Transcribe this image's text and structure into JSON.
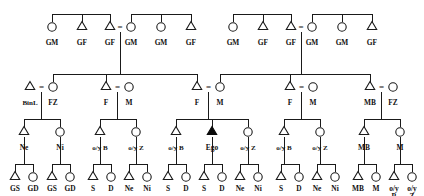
{
  "diagram": {
    "type": "pedigree",
    "symbols": {
      "male": "triangle",
      "female": "circle",
      "ego": "filled-triangle",
      "mating": "="
    },
    "colors": {
      "line": "#1a1a1a",
      "fill_ego": "#0a0a0a",
      "background": "#ffffff"
    }
  },
  "generations": [
    {
      "id": "g1",
      "y": 28,
      "label_y": 45,
      "people": [
        {
          "id": "g1p1",
          "x": 52,
          "sex": "female",
          "label": "GM"
        },
        {
          "id": "g1p2",
          "x": 82,
          "sex": "male",
          "label": "GF"
        },
        {
          "id": "g1p3",
          "x": 110,
          "sex": "male",
          "label": "GF"
        },
        {
          "id": "g1p4",
          "x": 131,
          "sex": "female",
          "label": "GM"
        },
        {
          "id": "g1p5",
          "x": 161,
          "sex": "female",
          "label": "GM"
        },
        {
          "id": "g1p6",
          "x": 191,
          "sex": "male",
          "label": "GF"
        },
        {
          "id": "g1p7",
          "x": 233,
          "sex": "female",
          "label": "GM"
        },
        {
          "id": "g1p8",
          "x": 263,
          "sex": "male",
          "label": "GF"
        },
        {
          "id": "g1p9",
          "x": 291,
          "sex": "male",
          "label": "GF"
        },
        {
          "id": "g1p10",
          "x": 312,
          "sex": "female",
          "label": "GM"
        },
        {
          "id": "g1p11",
          "x": 342,
          "sex": "female",
          "label": "GM"
        },
        {
          "id": "g1p12",
          "x": 372,
          "sex": "male",
          "label": "GF"
        }
      ],
      "matings": [
        {
          "id": "g1m1",
          "x": 120,
          "left": "g1p3",
          "right": "g1p4"
        },
        {
          "id": "g1m2",
          "x": 301,
          "left": "g1p9",
          "right": "g1p10"
        }
      ]
    },
    {
      "id": "g2",
      "y": 88,
      "label_y": 105,
      "people": [
        {
          "id": "g2p1",
          "x": 30,
          "sex": "male",
          "label": "BinL"
        },
        {
          "id": "g2p2",
          "x": 53,
          "sex": "female",
          "label": "FZ"
        },
        {
          "id": "g2p3",
          "x": 106,
          "sex": "male",
          "label": "F"
        },
        {
          "id": "g2p4",
          "x": 129,
          "sex": "female",
          "label": "M"
        },
        {
          "id": "g2p5",
          "x": 197,
          "sex": "male",
          "label": "F"
        },
        {
          "id": "g2p6",
          "x": 220,
          "sex": "female",
          "label": "M"
        },
        {
          "id": "g2p7",
          "x": 290,
          "sex": "male",
          "label": "F"
        },
        {
          "id": "g2p8",
          "x": 313,
          "sex": "female",
          "label": "M"
        },
        {
          "id": "g2p9",
          "x": 370,
          "sex": "male",
          "label": "MB"
        },
        {
          "id": "g2p10",
          "x": 393,
          "sex": "female",
          "label": "FZ"
        }
      ],
      "matings": [
        {
          "id": "g2m1",
          "x": 41.5,
          "left": "g2p1",
          "right": "g2p2"
        },
        {
          "id": "g2m2",
          "x": 117.5,
          "left": "g2p3",
          "right": "g2p4"
        },
        {
          "id": "g2m3",
          "x": 208.5,
          "left": "g2p5",
          "right": "g2p6"
        },
        {
          "id": "g2m4",
          "x": 301.5,
          "left": "g2p7",
          "right": "g2p8"
        },
        {
          "id": "g2m5",
          "x": 381.5,
          "left": "g2p9",
          "right": "g2p10"
        }
      ]
    },
    {
      "id": "g3",
      "y": 133,
      "label_y": 150,
      "people": [
        {
          "id": "g3p1",
          "x": 24,
          "sex": "male",
          "label": "Ne"
        },
        {
          "id": "g3p2",
          "x": 60,
          "sex": "female",
          "label": "Ni"
        },
        {
          "id": "g3p3",
          "x": 100,
          "sex": "male",
          "label": "o/y B"
        },
        {
          "id": "g3p4",
          "x": 136,
          "sex": "female",
          "label": "o/y Z"
        },
        {
          "id": "g3p5",
          "x": 176,
          "sex": "male",
          "label": "o/y B"
        },
        {
          "id": "g3p6",
          "x": 212,
          "sex": "ego",
          "label": "Ego"
        },
        {
          "id": "g3p7",
          "x": 248,
          "sex": "female",
          "label": "o/y Z"
        },
        {
          "id": "g3p8",
          "x": 284,
          "sex": "male",
          "label": "o/y B"
        },
        {
          "id": "g3p9",
          "x": 320,
          "sex": "female",
          "label": "o/y Z"
        },
        {
          "id": "g3p10",
          "x": 364,
          "sex": "male",
          "label": "MB"
        },
        {
          "id": "g3p11",
          "x": 400,
          "sex": "female",
          "label": "M"
        }
      ]
    },
    {
      "id": "g4",
      "y": 178,
      "label_y": 191,
      "people": [
        {
          "id": "g4p1",
          "x": 15,
          "sex": "male",
          "label": "GS"
        },
        {
          "id": "g4p2",
          "x": 33,
          "sex": "female",
          "label": "GD"
        },
        {
          "id": "g4p3",
          "x": 52,
          "sex": "male",
          "label": "GS"
        },
        {
          "id": "g4p4",
          "x": 70,
          "sex": "female",
          "label": "GD"
        },
        {
          "id": "g4p5",
          "x": 93,
          "sex": "male",
          "label": "S"
        },
        {
          "id": "g4p6",
          "x": 111,
          "sex": "female",
          "label": "D"
        },
        {
          "id": "g4p7",
          "x": 129,
          "sex": "male",
          "label": "Ne"
        },
        {
          "id": "g4p8",
          "x": 147,
          "sex": "female",
          "label": "Ni"
        },
        {
          "id": "g4p9",
          "x": 168,
          "sex": "male",
          "label": "S"
        },
        {
          "id": "g4p10",
          "x": 186,
          "sex": "female",
          "label": "D"
        },
        {
          "id": "g4p11",
          "x": 204,
          "sex": "male",
          "label": "S"
        },
        {
          "id": "g4p12",
          "x": 222,
          "sex": "female",
          "label": "D"
        },
        {
          "id": "g4p13",
          "x": 240,
          "sex": "male",
          "label": "Ne"
        },
        {
          "id": "g4p14",
          "x": 258,
          "sex": "female",
          "label": "Ni"
        },
        {
          "id": "g4p15",
          "x": 281,
          "sex": "male",
          "label": "S"
        },
        {
          "id": "g4p16",
          "x": 299,
          "sex": "female",
          "label": "D"
        },
        {
          "id": "g4p17",
          "x": 317,
          "sex": "male",
          "label": "Ne"
        },
        {
          "id": "g4p18",
          "x": 335,
          "sex": "female",
          "label": "Ni"
        },
        {
          "id": "g4p19",
          "x": 358,
          "sex": "male",
          "label": "MB"
        },
        {
          "id": "g4p20",
          "x": 376,
          "sex": "female",
          "label": "M"
        },
        {
          "id": "g4p21",
          "x": 394,
          "sex": "male",
          "label": "o/y",
          "label2": "B"
        },
        {
          "id": "g4p22",
          "x": 412,
          "sex": "female",
          "label": "o/y",
          "label2": "Z"
        }
      ]
    }
  ],
  "sibships": [
    {
      "id": "s1",
      "bar_y": 14,
      "drop_to": 22,
      "parent_drop_x": null,
      "children_x": [
        52,
        82,
        110
      ]
    },
    {
      "id": "s2",
      "bar_y": 14,
      "drop_to": 22,
      "parent_drop_x": null,
      "children_x": [
        131,
        161,
        191
      ]
    },
    {
      "id": "s3",
      "bar_y": 14,
      "drop_to": 22,
      "parent_drop_x": null,
      "children_x": [
        233,
        263,
        291
      ]
    },
    {
      "id": "s4",
      "bar_y": 14,
      "drop_to": 22,
      "parent_drop_x": null,
      "children_x": [
        312,
        342,
        372
      ]
    },
    {
      "id": "s5",
      "bar_y": 74,
      "drop_to": 82,
      "parent_drop_x": 120,
      "children_x": [
        53,
        106,
        197
      ]
    },
    {
      "id": "s6",
      "bar_y": 74,
      "drop_to": 82,
      "parent_drop_x": 301,
      "children_x": [
        220,
        290,
        370
      ]
    },
    {
      "id": "s7",
      "bar_y": 119,
      "drop_to": 127,
      "parent_drop_x": 41.5,
      "children_x": [
        24,
        60
      ]
    },
    {
      "id": "s8",
      "bar_y": 119,
      "drop_to": 127,
      "parent_drop_x": 117.5,
      "children_x": [
        100,
        136
      ]
    },
    {
      "id": "s9",
      "bar_y": 119,
      "drop_to": 127,
      "parent_drop_x": 208.5,
      "children_x": [
        176,
        212,
        248
      ]
    },
    {
      "id": "s10",
      "bar_y": 119,
      "drop_to": 127,
      "parent_drop_x": 301.5,
      "children_x": [
        284,
        320
      ]
    },
    {
      "id": "s11",
      "bar_y": 119,
      "drop_to": 127,
      "parent_drop_x": 381.5,
      "children_x": [
        364,
        400
      ]
    },
    {
      "id": "s12",
      "bar_y": 164,
      "drop_to": 172,
      "parent_drop_x": 24,
      "children_x": [
        15,
        33
      ]
    },
    {
      "id": "s13",
      "bar_y": 164,
      "drop_to": 172,
      "parent_drop_x": 60,
      "children_x": [
        52,
        70
      ]
    },
    {
      "id": "s14",
      "bar_y": 164,
      "drop_to": 172,
      "parent_drop_x": 100,
      "children_x": [
        93,
        111
      ]
    },
    {
      "id": "s15",
      "bar_y": 164,
      "drop_to": 172,
      "parent_drop_x": 136,
      "children_x": [
        129,
        147
      ]
    },
    {
      "id": "s16",
      "bar_y": 164,
      "drop_to": 172,
      "parent_drop_x": 176,
      "children_x": [
        168,
        186
      ]
    },
    {
      "id": "s17",
      "bar_y": 164,
      "drop_to": 172,
      "parent_drop_x": 212,
      "children_x": [
        204,
        222
      ]
    },
    {
      "id": "s18",
      "bar_y": 164,
      "drop_to": 172,
      "parent_drop_x": 248,
      "children_x": [
        240,
        258
      ]
    },
    {
      "id": "s19",
      "bar_y": 164,
      "drop_to": 172,
      "parent_drop_x": 284,
      "children_x": [
        281,
        299
      ]
    },
    {
      "id": "s20",
      "bar_y": 164,
      "drop_to": 172,
      "parent_drop_x": 320,
      "children_x": [
        317,
        335
      ]
    },
    {
      "id": "s21",
      "bar_y": 164,
      "drop_to": 172,
      "parent_drop_x": 364,
      "children_x": [
        358,
        376
      ]
    },
    {
      "id": "s22",
      "bar_y": 164,
      "drop_to": 172,
      "parent_drop_x": 400,
      "children_x": [
        394,
        412
      ]
    }
  ],
  "mating_drops": [
    {
      "id": "d1",
      "x": 120,
      "y1": 32,
      "y2": 74
    },
    {
      "id": "d2",
      "x": 301,
      "y1": 32,
      "y2": 74
    },
    {
      "id": "d3",
      "x": 41.5,
      "y1": 92,
      "y2": 119
    },
    {
      "id": "d4",
      "x": 117.5,
      "y1": 92,
      "y2": 119
    },
    {
      "id": "d5",
      "x": 208.5,
      "y1": 92,
      "y2": 119
    },
    {
      "id": "d6",
      "x": 301.5,
      "y1": 92,
      "y2": 119
    },
    {
      "id": "d7",
      "x": 381.5,
      "y1": 92,
      "y2": 119
    },
    {
      "id": "d8",
      "x": 24,
      "y1": 137,
      "y2": 164
    },
    {
      "id": "d9",
      "x": 60,
      "y1": 137,
      "y2": 164
    },
    {
      "id": "d10",
      "x": 100,
      "y1": 137,
      "y2": 164
    },
    {
      "id": "d11",
      "x": 136,
      "y1": 137,
      "y2": 164
    },
    {
      "id": "d12",
      "x": 176,
      "y1": 137,
      "y2": 164
    },
    {
      "id": "d13",
      "x": 212,
      "y1": 137,
      "y2": 164
    },
    {
      "id": "d14",
      "x": 248,
      "y1": 137,
      "y2": 164
    },
    {
      "id": "d15",
      "x": 284,
      "y1": 137,
      "y2": 164
    },
    {
      "id": "d16",
      "x": 320,
      "y1": 137,
      "y2": 164
    },
    {
      "id": "d17",
      "x": 364,
      "y1": 137,
      "y2": 164
    },
    {
      "id": "d18",
      "x": 400,
      "y1": 137,
      "y2": 164
    }
  ],
  "legend_keys": {
    "GM": "Grandmother",
    "GF": "Grandfather",
    "F": "Father",
    "M": "Mother",
    "FZ": "Father's sister",
    "MB": "Mother's brother",
    "BinL": "Brother-in-law",
    "Ego": "Ego",
    "o/y B": "older/younger Brother",
    "o/y Z": "older/younger Sister",
    "S": "Son",
    "D": "Daughter",
    "Ne": "Nephew",
    "Ni": "Niece",
    "GS": "Grandson",
    "GD": "Granddaughter"
  }
}
